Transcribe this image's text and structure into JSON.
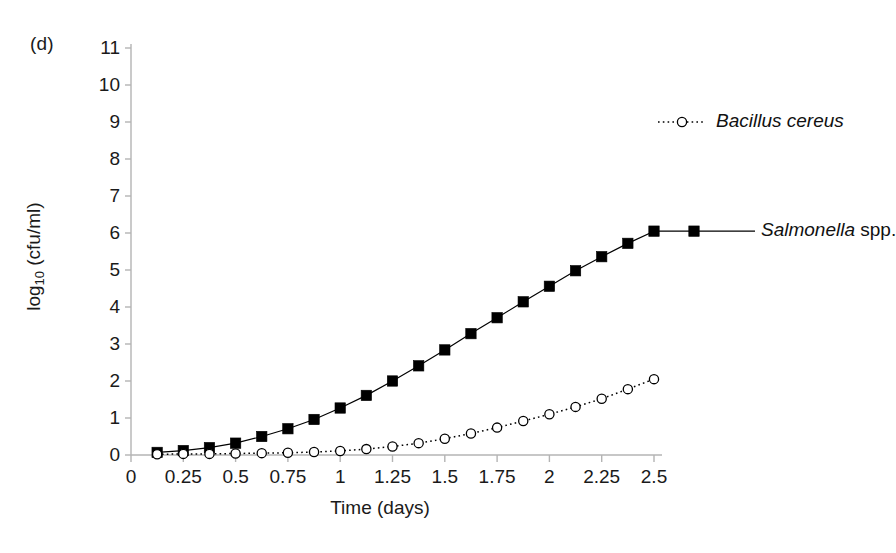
{
  "figure": {
    "panel_label": "(d)",
    "background_color": "#ffffff",
    "axis_color": "#b4b4b4",
    "ink_color": "#000000"
  },
  "axes": {
    "x": {
      "title": "Time (days)",
      "ticks": [
        "0",
        "0.25",
        "0.5",
        "0.75",
        "1",
        "1.25",
        "1.5",
        "1.75",
        "2",
        "2.25",
        "2.5"
      ],
      "min": 0,
      "max": 2.5
    },
    "y": {
      "title_main": "log",
      "title_sub": "10",
      "title_rest": " (cfu/ml)",
      "ticks": [
        "0",
        "1",
        "2",
        "3",
        "4",
        "5",
        "6",
        "7",
        "8",
        "9",
        "10",
        "11"
      ],
      "min": 0,
      "max": 11
    }
  },
  "legend": {
    "items": [
      {
        "name": "bacillus-cereus",
        "label_italic": "Bacillus cereus",
        "label_plain": "",
        "marker": "open-circle",
        "line_style": "dotted",
        "color": "#000000"
      },
      {
        "name": "salmonella-spp",
        "label_italic": "Salmonella",
        "label_plain": " spp.",
        "marker": "filled-square",
        "line_style": "solid",
        "color": "#000000"
      }
    ]
  },
  "chart_data": {
    "type": "line",
    "title": "",
    "subtitle": "",
    "xlabel": "Time (days)",
    "ylabel": "log10 (cfu/ml)",
    "xlim": [
      0,
      2.5
    ],
    "ylim": [
      0,
      11
    ],
    "xticks": [
      0,
      0.25,
      0.5,
      0.75,
      1,
      1.25,
      1.5,
      1.75,
      2,
      2.25,
      2.5
    ],
    "yticks": [
      0,
      1,
      2,
      3,
      4,
      5,
      6,
      7,
      8,
      9,
      10,
      11
    ],
    "grid": false,
    "legend_position": "inline-right",
    "annotations": [
      "(d)"
    ],
    "x": [
      0.125,
      0.25,
      0.375,
      0.5,
      0.625,
      0.75,
      0.875,
      1.0,
      1.125,
      1.25,
      1.375,
      1.5,
      1.625,
      1.75,
      1.875,
      2.0,
      2.125,
      2.25,
      2.375,
      2.5
    ],
    "series": [
      {
        "name": "Salmonella spp.",
        "marker": "filled-square",
        "line_style": "solid",
        "color": "#000000",
        "values": [
          0.07,
          0.12,
          0.2,
          0.32,
          0.5,
          0.71,
          0.96,
          1.27,
          1.61,
          2.0,
          2.41,
          2.84,
          3.28,
          3.71,
          4.14,
          4.56,
          4.98,
          5.36,
          5.72,
          6.05
        ]
      },
      {
        "name": "Bacillus cereus",
        "marker": "open-circle",
        "line_style": "dotted",
        "color": "#000000",
        "values": [
          0.02,
          0.03,
          0.03,
          0.04,
          0.05,
          0.06,
          0.08,
          0.11,
          0.16,
          0.23,
          0.32,
          0.44,
          0.58,
          0.74,
          0.92,
          1.1,
          1.3,
          1.52,
          1.78,
          2.05
        ]
      }
    ]
  }
}
